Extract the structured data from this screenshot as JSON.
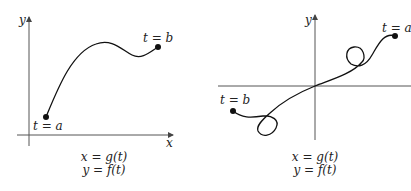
{
  "diagrams": [
    {
      "id": "left",
      "axes": {
        "x_label": "x",
        "y_label": "y"
      },
      "start_label": "t = a",
      "end_label": "t = b",
      "equations": {
        "x": "x = g(t)",
        "y": "y = f(t)"
      },
      "description": "Simple parametric curve rising from t = a to a peak, dipping, then ending at t = b"
    },
    {
      "id": "right",
      "axes": {
        "x_label": "",
        "y_label": "y"
      },
      "start_label": "t = a",
      "end_label": "t = b",
      "equations": {
        "x": "x = g(t)",
        "y": "y = f(t)"
      },
      "description": "Parametric curve from t = a (upper right) with a loop, passing through origin, another loop, ending at t = b (lower left)"
    }
  ],
  "colors": {
    "curve": "#111111",
    "axis": "#555555",
    "background": "#ffffff"
  }
}
